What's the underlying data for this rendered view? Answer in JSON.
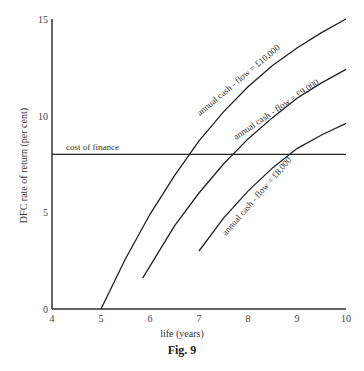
{
  "chart_data": {
    "type": "line",
    "title": "Fig. 9",
    "xlabel": "life (years)",
    "ylabel": "DFC rate of return (per cent)",
    "xlim": [
      4,
      10
    ],
    "ylim": [
      0,
      15
    ],
    "x_ticks": [
      4,
      5,
      6,
      7,
      8,
      9,
      10
    ],
    "y_ticks": [
      0,
      5,
      10,
      15
    ],
    "grid": false,
    "series": [
      {
        "name": "annual cash - flow = £10,000",
        "x": [
          5,
          5.5,
          6,
          6.5,
          7,
          7.5,
          8,
          8.5,
          9,
          9.5,
          10
        ],
        "y": [
          0,
          2.6,
          4.9,
          6.9,
          8.7,
          10.2,
          11.5,
          12.6,
          13.5,
          14.3,
          15.0
        ]
      },
      {
        "name": "annual cash - flow = £9,000",
        "x": [
          5.85,
          6.5,
          7,
          7.5,
          8,
          8.5,
          9,
          9.5,
          10
        ],
        "y": [
          1.6,
          4.3,
          6.0,
          7.5,
          8.8,
          9.9,
          10.9,
          11.7,
          12.4
        ]
      },
      {
        "name": "annual cash - flow = £8,000",
        "x": [
          7,
          7.5,
          8,
          8.5,
          9,
          9.5,
          10
        ],
        "y": [
          3.0,
          4.7,
          6.1,
          7.3,
          8.3,
          9.0,
          9.6
        ]
      },
      {
        "name": "cost of finance",
        "x": [
          4,
          10
        ],
        "y": [
          8,
          8
        ]
      }
    ],
    "annotations": [
      "cost of finance",
      "annual cash - flow = £10,000",
      "annual cash - flow = £9,000",
      "annual cash - flow = £8,000"
    ]
  },
  "labels": {
    "xlabel": "life (years)",
    "ylabel": "DFC rate of return (per cent)",
    "caption": "Fig. 9",
    "cost": "cost of finance",
    "c10": "annual cash - flow = £10,000",
    "c9": "annual cash - flow = £9,000",
    "c8": "annual cash - flow = £8,000"
  }
}
